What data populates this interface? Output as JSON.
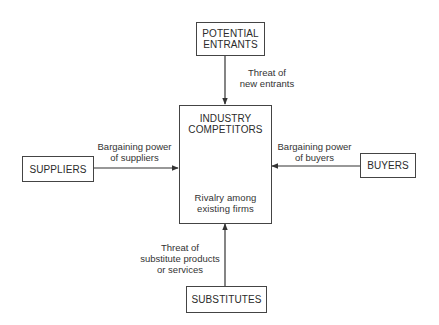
{
  "diagram": {
    "type": "five-forces",
    "nodes": {
      "entrants": {
        "label_line1": "POTENTIAL",
        "label_line2": "ENTRANTS"
      },
      "competitors": {
        "label_line1": "INDUSTRY",
        "label_line2": "COMPETITORS",
        "sub_line1": "Rivalry among",
        "sub_line2": "existing firms"
      },
      "suppliers": {
        "label": "SUPPLIERS"
      },
      "buyers": {
        "label": "BUYERS"
      },
      "substitutes": {
        "label": "SUBSTITUTES"
      }
    },
    "edges": {
      "entrants_to_competitors": {
        "line1": "Threat of",
        "line2": "new entrants"
      },
      "suppliers_to_competitors": {
        "line1": "Bargaining power",
        "line2": "of suppliers"
      },
      "buyers_to_competitors": {
        "line1": "Bargaining power",
        "line2": "of buyers"
      },
      "substitutes_to_competitors": {
        "line1": "Threat of",
        "line2": "substitute products",
        "line3": "or services"
      }
    },
    "colors": {
      "stroke": "#444444",
      "text": "#2b2b2b",
      "background": "#ffffff"
    }
  }
}
